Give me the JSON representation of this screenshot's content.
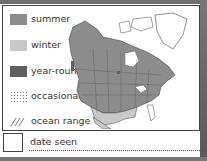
{
  "legend": {
    "items": [
      {
        "label": "summer",
        "color": "#8c8c8c",
        "pattern": "solid"
      },
      {
        "label": "winter",
        "color": "#c8c8c8",
        "pattern": "solid"
      },
      {
        "label": "year-round",
        "color": "#5f5f5f",
        "pattern": "solid"
      },
      {
        "label": "occasional",
        "color": "#888888",
        "pattern": "dots"
      },
      {
        "label": "ocean range",
        "color": "#888888",
        "pattern": "hatch"
      }
    ]
  },
  "map": {
    "region": "North America",
    "icon": "range-map"
  },
  "footer": {
    "date_label": "date seen"
  }
}
